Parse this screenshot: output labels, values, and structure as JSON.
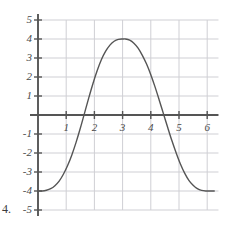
{
  "problem": {
    "number": "4."
  },
  "chart_data": {
    "type": "line",
    "title": "",
    "subtitle": "",
    "xlabel": "",
    "ylabel": "",
    "xlim": [
      0,
      6.4
    ],
    "ylim": [
      -5,
      5
    ],
    "grid": true,
    "legend": null,
    "annotations": [],
    "axis": {
      "x_axis_at_y": 0,
      "y_axis_at_x": 0,
      "x_ticks": [
        1,
        2,
        3,
        4,
        5,
        6
      ],
      "y_ticks": [
        -5,
        -4,
        -3,
        -2,
        -1,
        1,
        2,
        3,
        4,
        5
      ],
      "x_tick_labels": [
        "1",
        "2",
        "3",
        "4",
        "5",
        "6"
      ],
      "y_tick_labels": [
        "-5",
        "-4",
        "-3",
        "-2",
        "-1",
        "1",
        "2",
        "3",
        "4",
        "5"
      ],
      "gridlines_x": [
        1,
        2,
        3,
        4,
        5,
        6
      ],
      "gridlines_y": [
        -5,
        -4,
        -3,
        -2,
        -1,
        1,
        2,
        3,
        4,
        5
      ]
    },
    "series": [
      {
        "name": "curve",
        "color": "#555555",
        "description": "cosine-like wave, amplitude 4, minimum -4 flat near x=0 and x=6, maximum +4 near x=3.1",
        "x": [
          0.0,
          0.15,
          0.3,
          0.45,
          0.6,
          0.75,
          0.9,
          1.05,
          1.2,
          1.35,
          1.5,
          1.65,
          1.8,
          1.95,
          2.1,
          2.25,
          2.4,
          2.55,
          2.7,
          2.85,
          3.0,
          3.1,
          3.25,
          3.4,
          3.55,
          3.7,
          3.85,
          4.0,
          4.15,
          4.3,
          4.45,
          4.6,
          4.75,
          4.9,
          5.05,
          5.2,
          5.35,
          5.5,
          5.65,
          5.8,
          5.95,
          6.1,
          6.25
        ],
        "y": [
          -4.0,
          -4.0,
          -3.96,
          -3.88,
          -3.72,
          -3.48,
          -3.12,
          -2.66,
          -2.1,
          -1.44,
          -0.7,
          0.1,
          0.9,
          1.66,
          2.34,
          2.92,
          3.36,
          3.68,
          3.88,
          3.98,
          4.0,
          4.0,
          3.94,
          3.78,
          3.52,
          3.14,
          2.68,
          2.12,
          1.48,
          0.78,
          0.06,
          -0.66,
          -1.36,
          -2.0,
          -2.58,
          -3.06,
          -3.44,
          -3.7,
          -3.88,
          -3.97,
          -4.0,
          -4.0,
          -4.0
        ],
        "key_points": {
          "maximum": {
            "x": 3.1,
            "y": 4
          },
          "minimum_left": {
            "x": 0.1,
            "y": -4
          },
          "minimum_right": {
            "x": 6.1,
            "y": -4
          },
          "zero_crossing_rising": {
            "x": 1.63,
            "y": 0
          },
          "zero_crossing_falling": {
            "x": 4.46,
            "y": 0
          }
        }
      }
    ]
  },
  "colors": {
    "curve": "#555555",
    "axis": "#555555",
    "grid": "#cfcfd4",
    "label_text": "#4a4a4a"
  }
}
